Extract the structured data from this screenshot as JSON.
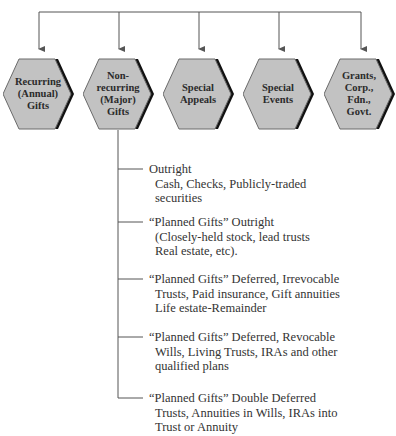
{
  "diagram": {
    "type": "hierarchy",
    "categories": [
      {
        "id": "recurring",
        "label": "Recurring\n(Annual)\nGifts"
      },
      {
        "id": "nonrecurring",
        "label": "Non-\nrecurring\n(Major)\nGifts"
      },
      {
        "id": "special-appeals",
        "label": "Special\nAppeals"
      },
      {
        "id": "special-events",
        "label": "Special\nEvents"
      },
      {
        "id": "grants",
        "label": "Grants,\nCorp.,\nFdn.,\nGovt."
      }
    ],
    "branch_parent": "nonrecurring",
    "branch_items": [
      {
        "title": "Outright",
        "detail": "Cash, Checks, Publicly-traded\nsecurities"
      },
      {
        "title": "“Planned Gifts” Outright",
        "detail": "(Closely-held stock, lead trusts\nReal estate, etc)."
      },
      {
        "title": "“Planned Gifts” Deferred, Irrevocable",
        "detail": "Trusts, Paid insurance, Gift annuities\nLife estate-Remainder"
      },
      {
        "title": "“Planned Gifts” Deferred, Revocable",
        "detail": "Wills, Living Trusts, IRAs and other\nqualified plans"
      },
      {
        "title": "“Planned Gifts” Double Deferred",
        "detail": "Trusts, Annuities in Wills, IRAs into\nTrust or Annuity"
      }
    ]
  },
  "colors": {
    "hex_fill": "#c2c2c2",
    "hex_stroke": "#6a6a6a",
    "hex_shadow": "#111111",
    "line": "#555555",
    "text": "#2b2b2b"
  }
}
